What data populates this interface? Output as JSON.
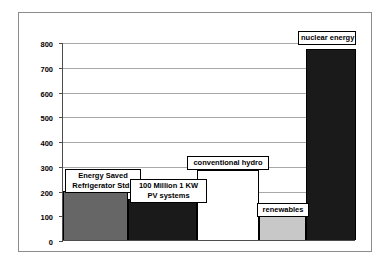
{
  "chart_data": {
    "type": "bar",
    "title": "",
    "xlabel": "",
    "ylabel": "Billion kWh/year",
    "ylim": [
      0,
      800
    ],
    "yticks": [
      0,
      100,
      200,
      300,
      400,
      500,
      600,
      700,
      800
    ],
    "ytick_labels": [
      "0",
      "100",
      "200",
      "300",
      "400",
      "500",
      "600",
      "700",
      "800"
    ],
    "grid": true,
    "legend": "none",
    "categories": [
      "Energy Saved Refrigerator Stds",
      "100 Million 1 KW PV systems",
      "conventional hydro",
      "renewables",
      "nuclear energy"
    ],
    "values": [
      200,
      168,
      285,
      105,
      775
    ],
    "colors": [
      "#666666",
      "#1a1a1a",
      "#ffffff",
      "#c8c8c8",
      "#1a1a1a"
    ],
    "bars": [
      {
        "label_line1": "Energy Saved",
        "label_line2": "Refrigerator Stds",
        "value": 200,
        "color": "#666666"
      },
      {
        "label_line1": "100 Million 1 KW",
        "label_line2": "PV systems",
        "value": 168,
        "color": "#1a1a1a"
      },
      {
        "label_line1": "conventional hydro",
        "label_line2": "",
        "value": 285,
        "color": "#ffffff"
      },
      {
        "label_line1": "renewables",
        "label_line2": "",
        "value": 105,
        "color": "#c8c8c8"
      },
      {
        "label_line1": "nuclear energy",
        "label_line2": "",
        "value": 775,
        "color": "#1a1a1a"
      }
    ]
  },
  "axis": {
    "y_title": "Billion kWh/year",
    "ticks": [
      {
        "label": "800",
        "value": 800
      },
      {
        "label": "700",
        "value": 700
      },
      {
        "label": "600",
        "value": 600
      },
      {
        "label": "500",
        "value": 500
      },
      {
        "label": "400",
        "value": 400
      },
      {
        "label": "300",
        "value": 300
      },
      {
        "label": "200",
        "value": 200
      },
      {
        "label": "100",
        "value": 100
      },
      {
        "label": "0",
        "value": 0
      }
    ]
  },
  "labels": {
    "bar1_line1": "Energy Saved",
    "bar1_line2": "Refrigerator Stds",
    "bar2_line1": "100 Million 1 KW",
    "bar2_line2": "PV systems",
    "bar3": "conventional hydro",
    "bar4": "renewables",
    "bar5": "nuclear energy"
  },
  "colors": {
    "bar1": "#666666",
    "bar2": "#1a1a1a",
    "bar3": "#ffffff",
    "bar4": "#c8c8c8",
    "bar5": "#1a1a1a",
    "gridline": "#a8a8a8",
    "axis": "#4d4d4d",
    "frame": "#8c8c8c"
  }
}
